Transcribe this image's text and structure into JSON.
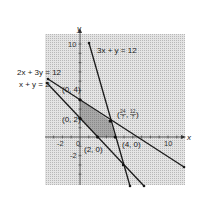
{
  "axes": {
    "x_label": "x",
    "y_label": "y",
    "x_ticks": [
      "-2",
      "0",
      "10"
    ],
    "y_ticks": [
      "10",
      "-2"
    ]
  },
  "lines": [
    {
      "id": "line1",
      "equation": "3x + y = 12"
    },
    {
      "id": "line2",
      "equation": "2x + 3y = 12"
    },
    {
      "id": "line3",
      "equation": "x + y = 2"
    }
  ],
  "points": [
    {
      "label": "(0, 4)"
    },
    {
      "label": "(0, 2)"
    },
    {
      "label": "(2, 0)"
    },
    {
      "label": "(4, 0)"
    },
    {
      "label": "(24/7, 12/7)",
      "num_x": "24",
      "den_x": "7",
      "num_y": "12",
      "den_y": "7"
    }
  ],
  "feasible_region": {
    "vertices": [
      "(0, 2)",
      "(0, 4)",
      "(24/7, 12/7)",
      "(4, 0)",
      "(2, 0)"
    ]
  },
  "colors": {
    "shade_light": "#cfcfcf",
    "shade_dark": "#9a9a9a",
    "line": "#1a1a1a"
  }
}
